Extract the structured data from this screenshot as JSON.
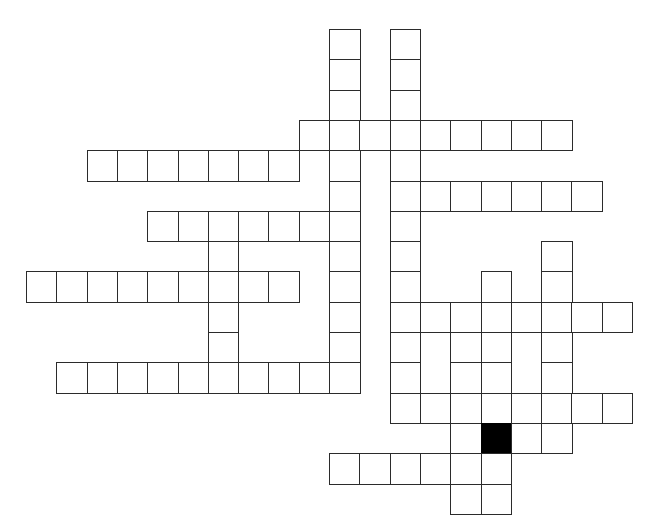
{
  "puzzle": {
    "type": "crossword-grid",
    "title": "",
    "background_color": "#ffffff",
    "cell_border_color": "#2b2b2b",
    "blocked_cell_color": "#000000",
    "empty_cell_color": "#ffffff",
    "cell_size_px": 30.3,
    "origin_x_px": 26,
    "origin_y_px": 29,
    "columns": 20,
    "rows": 16,
    "entry_count": 21,
    "blocked_cell_count": 1,
    "filled_cell_count": 0,
    "entries": [
      {
        "id": "d1",
        "direction": "down",
        "col": 10,
        "row": 0,
        "length": 12
      },
      {
        "id": "d2",
        "direction": "down",
        "col": 12,
        "row": 0,
        "length": 13
      },
      {
        "id": "a1",
        "direction": "across",
        "col": 9,
        "row": 3,
        "length": 9
      },
      {
        "id": "a2",
        "direction": "across",
        "col": 2,
        "row": 4,
        "length": 7
      },
      {
        "id": "a3",
        "direction": "across",
        "col": 12,
        "row": 5,
        "length": 7
      },
      {
        "id": "a4",
        "direction": "across",
        "col": 4,
        "row": 6,
        "length": 6
      },
      {
        "id": "d3",
        "direction": "down",
        "col": 6,
        "row": 6,
        "length": 6
      },
      {
        "id": "a5",
        "direction": "across",
        "col": 0,
        "row": 8,
        "length": 9
      },
      {
        "id": "d4",
        "direction": "down",
        "col": 17,
        "row": 7,
        "length": 5
      },
      {
        "id": "d5",
        "direction": "down",
        "col": 15,
        "row": 8,
        "length": 8
      },
      {
        "id": "a6",
        "direction": "across",
        "col": 12,
        "row": 9,
        "length": 8
      },
      {
        "id": "a7",
        "direction": "across",
        "col": 1,
        "row": 11,
        "length": 10
      },
      {
        "id": "d6",
        "direction": "down",
        "col": 14,
        "row": 10,
        "length": 6
      },
      {
        "id": "a8",
        "direction": "across",
        "col": 12,
        "row": 12,
        "length": 8
      },
      {
        "id": "a9",
        "direction": "across",
        "col": 10,
        "row": 14,
        "length": 6
      },
      {
        "id": "d7",
        "direction": "down",
        "col": 16,
        "row": 12,
        "length": 2
      }
    ],
    "cells": [
      {
        "col": 10,
        "row": 0
      },
      {
        "col": 12,
        "row": 0
      },
      {
        "col": 10,
        "row": 1
      },
      {
        "col": 12,
        "row": 1
      },
      {
        "col": 10,
        "row": 2
      },
      {
        "col": 12,
        "row": 2
      },
      {
        "col": 9,
        "row": 3
      },
      {
        "col": 10,
        "row": 3
      },
      {
        "col": 11,
        "row": 3
      },
      {
        "col": 12,
        "row": 3
      },
      {
        "col": 13,
        "row": 3
      },
      {
        "col": 14,
        "row": 3
      },
      {
        "col": 15,
        "row": 3
      },
      {
        "col": 16,
        "row": 3
      },
      {
        "col": 17,
        "row": 3
      },
      {
        "col": 2,
        "row": 4
      },
      {
        "col": 3,
        "row": 4
      },
      {
        "col": 4,
        "row": 4
      },
      {
        "col": 5,
        "row": 4
      },
      {
        "col": 6,
        "row": 4
      },
      {
        "col": 7,
        "row": 4
      },
      {
        "col": 8,
        "row": 4
      },
      {
        "col": 10,
        "row": 4
      },
      {
        "col": 12,
        "row": 4
      },
      {
        "col": 10,
        "row": 5
      },
      {
        "col": 12,
        "row": 5
      },
      {
        "col": 13,
        "row": 5
      },
      {
        "col": 14,
        "row": 5
      },
      {
        "col": 15,
        "row": 5
      },
      {
        "col": 16,
        "row": 5
      },
      {
        "col": 17,
        "row": 5
      },
      {
        "col": 18,
        "row": 5
      },
      {
        "col": 4,
        "row": 6
      },
      {
        "col": 5,
        "row": 6
      },
      {
        "col": 6,
        "row": 6
      },
      {
        "col": 7,
        "row": 6
      },
      {
        "col": 8,
        "row": 6
      },
      {
        "col": 9,
        "row": 6
      },
      {
        "col": 10,
        "row": 6
      },
      {
        "col": 12,
        "row": 6
      },
      {
        "col": 6,
        "row": 7
      },
      {
        "col": 10,
        "row": 7
      },
      {
        "col": 12,
        "row": 7
      },
      {
        "col": 17,
        "row": 7
      },
      {
        "col": 0,
        "row": 8
      },
      {
        "col": 1,
        "row": 8
      },
      {
        "col": 2,
        "row": 8
      },
      {
        "col": 3,
        "row": 8
      },
      {
        "col": 4,
        "row": 8
      },
      {
        "col": 5,
        "row": 8
      },
      {
        "col": 6,
        "row": 8
      },
      {
        "col": 7,
        "row": 8
      },
      {
        "col": 8,
        "row": 8
      },
      {
        "col": 10,
        "row": 8
      },
      {
        "col": 12,
        "row": 8
      },
      {
        "col": 15,
        "row": 8
      },
      {
        "col": 17,
        "row": 8
      },
      {
        "col": 6,
        "row": 9
      },
      {
        "col": 10,
        "row": 9
      },
      {
        "col": 12,
        "row": 9
      },
      {
        "col": 13,
        "row": 9
      },
      {
        "col": 14,
        "row": 9
      },
      {
        "col": 15,
        "row": 9
      },
      {
        "col": 16,
        "row": 9
      },
      {
        "col": 17,
        "row": 9
      },
      {
        "col": 18,
        "row": 9
      },
      {
        "col": 19,
        "row": 9
      },
      {
        "col": 6,
        "row": 10
      },
      {
        "col": 10,
        "row": 10
      },
      {
        "col": 12,
        "row": 10
      },
      {
        "col": 14,
        "row": 10
      },
      {
        "col": 15,
        "row": 10
      },
      {
        "col": 17,
        "row": 10
      },
      {
        "col": 1,
        "row": 11
      },
      {
        "col": 2,
        "row": 11
      },
      {
        "col": 3,
        "row": 11
      },
      {
        "col": 4,
        "row": 11
      },
      {
        "col": 5,
        "row": 11
      },
      {
        "col": 6,
        "row": 11
      },
      {
        "col": 7,
        "row": 11
      },
      {
        "col": 8,
        "row": 11
      },
      {
        "col": 9,
        "row": 11
      },
      {
        "col": 10,
        "row": 11
      },
      {
        "col": 12,
        "row": 11
      },
      {
        "col": 14,
        "row": 11
      },
      {
        "col": 15,
        "row": 11
      },
      {
        "col": 17,
        "row": 11
      },
      {
        "col": 12,
        "row": 12
      },
      {
        "col": 13,
        "row": 12
      },
      {
        "col": 14,
        "row": 12
      },
      {
        "col": 15,
        "row": 12
      },
      {
        "col": 16,
        "row": 12
      },
      {
        "col": 17,
        "row": 12
      },
      {
        "col": 18,
        "row": 12
      },
      {
        "col": 19,
        "row": 12
      },
      {
        "col": 14,
        "row": 13
      },
      {
        "col": 15,
        "row": 13,
        "blocked": true
      },
      {
        "col": 16,
        "row": 13
      },
      {
        "col": 17,
        "row": 13
      },
      {
        "col": 10,
        "row": 14
      },
      {
        "col": 11,
        "row": 14
      },
      {
        "col": 12,
        "row": 14
      },
      {
        "col": 13,
        "row": 14
      },
      {
        "col": 14,
        "row": 14
      },
      {
        "col": 15,
        "row": 14
      },
      {
        "col": 14,
        "row": 15
      },
      {
        "col": 15,
        "row": 15
      }
    ]
  }
}
